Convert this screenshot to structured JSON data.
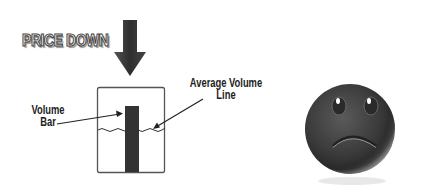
{
  "diagram": {
    "title": "PRICE DOWN",
    "labels": {
      "volume_bar": [
        "Volume",
        "Bar"
      ],
      "average_volume_line": [
        "Average Volume",
        "Line"
      ]
    },
    "icons": {
      "arrow": "down-arrow-icon",
      "face": "sad-face-icon"
    },
    "colors": {
      "arrow": "#3a3a3a",
      "bar": "#333333",
      "box_border": "#555555",
      "face": "#444444"
    }
  }
}
